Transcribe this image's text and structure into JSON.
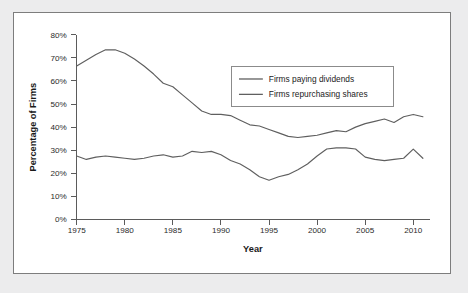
{
  "chart_data": {
    "type": "line",
    "title": "",
    "xlabel": "Year",
    "ylabel": "Percentage of Firms",
    "xlim": [
      1975,
      2011
    ],
    "ylim": [
      0,
      80
    ],
    "grid": false,
    "legend_position": "top-right-inside",
    "xticks": [
      "1975",
      "1980",
      "1985",
      "1990",
      "1995",
      "2000",
      "2005",
      "2010"
    ],
    "xtick_values": [
      1975,
      1980,
      1985,
      1990,
      1995,
      2000,
      2005,
      2010
    ],
    "yticks": [
      "0%",
      "10%",
      "20%",
      "30%",
      "40%",
      "50%",
      "60%",
      "70%",
      "80%"
    ],
    "ytick_values": [
      0,
      10,
      20,
      30,
      40,
      50,
      60,
      70,
      80
    ],
    "x": [
      1975,
      1976,
      1977,
      1978,
      1979,
      1980,
      1981,
      1982,
      1983,
      1984,
      1985,
      1986,
      1987,
      1988,
      1989,
      1990,
      1991,
      1992,
      1993,
      1994,
      1995,
      1996,
      1997,
      1998,
      1999,
      2000,
      2001,
      2002,
      2003,
      2004,
      2005,
      2006,
      2007,
      2008,
      2009,
      2010,
      2011
    ],
    "series": [
      {
        "name": "Firms paying dividends",
        "color": "#5f5f5f",
        "values": [
          66.5,
          69.0,
          71.5,
          73.5,
          73.5,
          72.0,
          69.5,
          66.5,
          63.0,
          59.0,
          57.5,
          54.0,
          50.5,
          47.0,
          45.5,
          45.5,
          45.0,
          43.0,
          41.0,
          40.5,
          39.0,
          37.5,
          36.0,
          35.5,
          36.0,
          36.5,
          37.5,
          38.5,
          38.0,
          40.0,
          41.5,
          42.5,
          43.5,
          42.0,
          44.5,
          45.5,
          44.5
        ]
      },
      {
        "name": "Firms repurchasing shares",
        "color": "#5f5f5f",
        "values": [
          27.5,
          26.0,
          27.0,
          27.5,
          27.0,
          26.5,
          26.0,
          26.5,
          27.5,
          28.0,
          27.0,
          27.5,
          29.5,
          29.0,
          29.5,
          28.0,
          25.5,
          24.0,
          21.5,
          18.5,
          17.0,
          18.5,
          19.5,
          21.5,
          24.0,
          27.5,
          30.5,
          31.0,
          31.0,
          30.5,
          27.0,
          26.0,
          25.5,
          26.0,
          26.5,
          30.5,
          26.5
        ]
      }
    ],
    "series_corrected_note": "",
    "legend": [
      {
        "label": "Firms paying dividends"
      },
      {
        "label": "Firms repurchasing shares"
      }
    ]
  }
}
